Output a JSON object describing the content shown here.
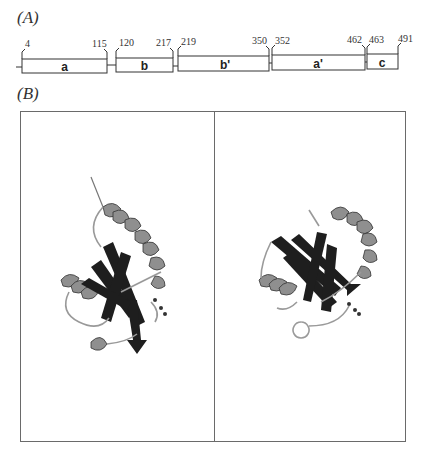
{
  "panels": {
    "a_label": "(A)",
    "b_label": "(B)"
  },
  "domain_map": {
    "domains": [
      {
        "name": "a",
        "start": "4",
        "end": "115"
      },
      {
        "name": "b",
        "start": "120",
        "end": "217"
      },
      {
        "name": "b'",
        "start": "219",
        "end": "350"
      },
      {
        "name": "a'",
        "start": "352",
        "end": "462"
      },
      {
        "name": "c",
        "start": "463",
        "end": "491"
      }
    ]
  },
  "structure_panel": {
    "views": [
      "ribbon-structure-left",
      "ribbon-structure-right"
    ],
    "colors": {
      "helix": "#8a8a8a",
      "strand": "#1e1e1e",
      "loop": "#9a9a9a",
      "frame": "#6a6a6a"
    }
  }
}
